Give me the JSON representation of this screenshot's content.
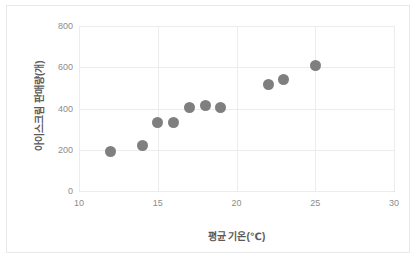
{
  "chart_data": {
    "type": "scatter",
    "title": "",
    "xlabel": "평균 기온(℃)",
    "ylabel": "아이스크림 판매량(개)",
    "xlim": [
      10,
      30
    ],
    "ylim": [
      0,
      800
    ],
    "xticks": [
      "10",
      "15",
      "20",
      "25",
      "30"
    ],
    "yticks": [
      "0",
      "200",
      "400",
      "600",
      "800"
    ],
    "xtick_values": [
      10,
      15,
      20,
      25,
      30
    ],
    "ytick_values": [
      0,
      200,
      400,
      600,
      800
    ],
    "grid": true,
    "legend": false,
    "marker_color": "#7f7f7f",
    "x": [
      12,
      14,
      15,
      16,
      17,
      18,
      19,
      22,
      23,
      25
    ],
    "y": [
      190,
      220,
      330,
      330,
      405,
      415,
      403,
      515,
      540,
      607
    ],
    "points": [
      {
        "x": 12,
        "y": 190
      },
      {
        "x": 14,
        "y": 220
      },
      {
        "x": 15,
        "y": 330
      },
      {
        "x": 16,
        "y": 330
      },
      {
        "x": 17,
        "y": 405
      },
      {
        "x": 18,
        "y": 415
      },
      {
        "x": 19,
        "y": 403
      },
      {
        "x": 22,
        "y": 515
      },
      {
        "x": 23,
        "y": 540
      },
      {
        "x": 25,
        "y": 607
      }
    ]
  },
  "colors": {
    "marker": "#7f7f7f",
    "grid": "#ececec",
    "axis": "#d9d9d9",
    "tick_text": "#8c8c8c",
    "title_text": "#5a5a5a",
    "frame": "#e8e8e8",
    "background": "#ffffff"
  }
}
